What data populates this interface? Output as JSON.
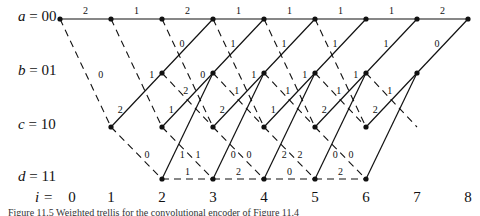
{
  "states": [
    {
      "sym": "a",
      "bits": "00"
    },
    {
      "sym": "b",
      "bits": "01"
    },
    {
      "sym": "c",
      "bits": "10"
    },
    {
      "sym": "d",
      "bits": "11"
    }
  ],
  "steps": {
    "prefix": "i =",
    "values": [
      "0",
      "1",
      "2",
      "3",
      "4",
      "5",
      "6",
      "7",
      "8"
    ]
  },
  "branch_labels": {
    "a_to_a": [
      "2",
      "1",
      "2",
      "1",
      "1",
      "1",
      "1",
      "2"
    ],
    "a_to_c": [
      "0",
      "1",
      "0",
      "1",
      "1",
      "1"
    ],
    "b_to_a": [
      "0",
      "1",
      "1",
      "1",
      "1",
      "0"
    ],
    "b_to_c": [
      "2",
      "1",
      "1",
      "1",
      "1"
    ],
    "c_to_b": [
      "2",
      "1",
      "2",
      "1",
      "2",
      "2"
    ],
    "c_to_d": [
      "0",
      "1",
      "0",
      "2",
      "0"
    ],
    "d_to_b": [
      "1",
      "0",
      "2",
      "0"
    ],
    "d_to_d": [
      "1",
      "2",
      "0",
      "2"
    ]
  },
  "caption": "Figure 11.5 Weighted trellis for the convolutional encoder of Figure 11.4"
}
